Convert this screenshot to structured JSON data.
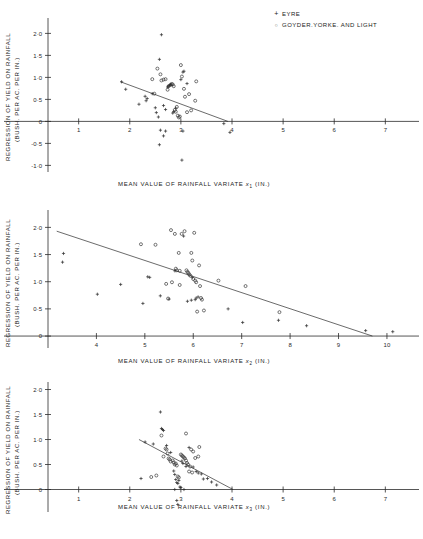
{
  "figure": {
    "legend": {
      "position": "top-right",
      "entries": [
        {
          "marker": "plus-marker",
          "symbol": "+",
          "label": "EYRE"
        },
        {
          "marker": "circle-marker",
          "symbol": "○",
          "label": "GOYDER.YORKE. AND LIGHT"
        }
      ]
    },
    "shared_ylabel_line1": "REGRESSION OF YIELD ON RAINFALL",
    "shared_ylabel_line2": "(BUSH. PER AC. PER IN.)"
  },
  "chart_data": [
    {
      "type": "scatter",
      "panel": 1,
      "title": "",
      "xlabel": "MEAN VALUE OF RAINFALL VARIATE x1 (IN.)",
      "xlabel_prefix": "MEAN VALUE OF RAINFALL  VARIATE ",
      "xlabel_var": "x",
      "xlabel_sub": "1",
      "xlabel_suffix": " (IN.)",
      "ylabel": "REGRESSION OF YIELD ON RAINFALL (BUSH. PER AC. PER IN.)",
      "xlim": [
        0.4,
        7.6
      ],
      "ylim": [
        -1.15,
        2.35
      ],
      "xticks": [
        1,
        2,
        3,
        4,
        5,
        6,
        7
      ],
      "xticklabels": [
        "1",
        "2",
        "3",
        "4",
        "5",
        "6",
        "7"
      ],
      "yticks": [
        -1.0,
        -0.5,
        0,
        0.5,
        1.0,
        1.5,
        2.0
      ],
      "yticklabels": [
        "-1·0",
        "-0·5",
        "0",
        "0·5",
        "1·0",
        "1·5",
        "2·0"
      ],
      "grid": false,
      "regression_line": {
        "x": [
          1.82,
          3.92
        ],
        "y": [
          0.9,
          0.0
        ]
      },
      "series": [
        {
          "name": "EYRE",
          "marker": "plus",
          "points": [
            [
              1.84,
              0.9
            ],
            [
              1.92,
              0.73
            ],
            [
              2.18,
              0.39
            ],
            [
              2.3,
              0.57
            ],
            [
              2.32,
              0.47
            ],
            [
              2.34,
              0.52
            ],
            [
              2.44,
              0.63
            ],
            [
              2.5,
              0.31
            ],
            [
              2.52,
              0.2
            ],
            [
              2.56,
              0.1
            ],
            [
              2.58,
              1.41
            ],
            [
              2.62,
              1.97
            ],
            [
              2.66,
              0.36
            ],
            [
              2.7,
              0.27
            ],
            [
              2.74,
              0.78
            ],
            [
              2.76,
              0.8
            ],
            [
              2.78,
              0.82
            ],
            [
              2.8,
              0.84
            ],
            [
              2.84,
              0.19
            ],
            [
              2.86,
              0.22
            ],
            [
              2.9,
              0.3
            ],
            [
              3.0,
              0.95
            ],
            [
              3.04,
              1.12
            ],
            [
              3.06,
              1.14
            ],
            [
              3.12,
              0.86
            ],
            [
              2.6,
              -0.2
            ],
            [
              2.7,
              -0.22
            ],
            [
              2.66,
              -0.33
            ],
            [
              2.58,
              -0.53
            ],
            [
              3.04,
              -0.22
            ],
            [
              3.84,
              -0.05
            ],
            [
              3.96,
              -0.25
            ],
            [
              3.02,
              -0.88
            ]
          ]
        },
        {
          "name": "GOYDER.YORKE. AND LIGHT",
          "marker": "circle",
          "points": [
            [
              2.54,
              1.2
            ],
            [
              2.6,
              1.07
            ],
            [
              2.62,
              0.93
            ],
            [
              2.66,
              0.95
            ],
            [
              2.7,
              0.96
            ],
            [
              2.74,
              0.72
            ],
            [
              2.76,
              0.8
            ],
            [
              2.8,
              0.83
            ],
            [
              2.82,
              0.85
            ],
            [
              2.84,
              0.84
            ],
            [
              2.86,
              0.8
            ],
            [
              2.88,
              0.26
            ],
            [
              2.9,
              0.22
            ],
            [
              2.92,
              0.33
            ],
            [
              2.94,
              0.13
            ],
            [
              2.96,
              0.09
            ],
            [
              2.98,
              0.11
            ],
            [
              3.0,
              1.28
            ],
            [
              3.02,
              1.02
            ],
            [
              3.06,
              0.74
            ],
            [
              3.08,
              0.56
            ],
            [
              3.12,
              0.21
            ],
            [
              3.16,
              0.62
            ],
            [
              3.2,
              0.25
            ],
            [
              3.28,
              0.47
            ],
            [
              3.3,
              0.91
            ],
            [
              2.48,
              0.63
            ],
            [
              2.44,
              0.96
            ]
          ]
        }
      ]
    },
    {
      "type": "scatter",
      "panel": 2,
      "title": "",
      "xlabel": "MEAN VALUE OF RAINFALL VARIATE x2 (IN.)",
      "xlabel_prefix": "MEAN VALUE OF RAINFALL  VARIATE ",
      "xlabel_var": "x",
      "xlabel_sub": "2",
      "xlabel_suffix": " (IN.)",
      "ylabel": "REGRESSION OF YIELD ON RAINFALL (BUSH. PER AC. PER IN.)",
      "xlim": [
        3.0,
        10.6
      ],
      "ylim": [
        -0.22,
        2.32
      ],
      "xticks": [
        4,
        5,
        6,
        7,
        8,
        9,
        10
      ],
      "xticklabels": [
        "4",
        "5",
        "6",
        "7",
        "8",
        "9",
        "10"
      ],
      "yticks": [
        0,
        0.5,
        1.0,
        1.5,
        2.0
      ],
      "yticklabels": [
        "0",
        "0·5",
        "1·0",
        "1·5",
        "2·0"
      ],
      "grid": false,
      "regression_line": {
        "x": [
          3.18,
          9.7
        ],
        "y": [
          1.93,
          0.0
        ]
      },
      "series": [
        {
          "name": "EYRE",
          "marker": "plus",
          "points": [
            [
              3.32,
              1.52
            ],
            [
              3.3,
              1.36
            ],
            [
              4.02,
              0.77
            ],
            [
              4.5,
              0.95
            ],
            [
              4.96,
              0.6
            ],
            [
              5.06,
              1.09
            ],
            [
              5.1,
              1.08
            ],
            [
              5.32,
              0.74
            ],
            [
              5.5,
              0.68
            ],
            [
              5.62,
              1.2
            ],
            [
              5.8,
              1.84
            ],
            [
              5.96,
              0.66
            ],
            [
              5.98,
              1.08
            ],
            [
              6.04,
              0.67
            ],
            [
              6.06,
              0.7
            ],
            [
              6.1,
              0.72
            ],
            [
              6.72,
              0.5
            ],
            [
              7.02,
              0.25
            ],
            [
              7.76,
              0.29
            ],
            [
              8.34,
              0.19
            ],
            [
              9.56,
              0.1
            ],
            [
              10.12,
              0.08
            ],
            [
              5.88,
              0.64
            ]
          ]
        },
        {
          "name": "GOYDER.YORKE. AND LIGHT",
          "marker": "circle",
          "points": [
            [
              4.92,
              1.69
            ],
            [
              5.22,
              1.68
            ],
            [
              5.54,
              1.95
            ],
            [
              5.62,
              1.88
            ],
            [
              5.64,
              1.24
            ],
            [
              5.66,
              1.21
            ],
            [
              5.7,
              1.53
            ],
            [
              5.72,
              1.2
            ],
            [
              5.76,
              1.88
            ],
            [
              5.82,
              1.93
            ],
            [
              5.86,
              1.21
            ],
            [
              5.88,
              1.18
            ],
            [
              5.9,
              1.16
            ],
            [
              5.92,
              1.13
            ],
            [
              5.94,
              1.11
            ],
            [
              5.96,
              1.53
            ],
            [
              5.98,
              1.39
            ],
            [
              6.0,
              1.05
            ],
            [
              6.02,
              1.9
            ],
            [
              6.04,
              1.02
            ],
            [
              6.06,
              0.99
            ],
            [
              6.12,
              1.3
            ],
            [
              6.14,
              0.92
            ],
            [
              6.16,
              0.7
            ],
            [
              6.18,
              0.67
            ],
            [
              6.22,
              0.47
            ],
            [
              6.52,
              1.02
            ],
            [
              7.08,
              0.92
            ],
            [
              7.78,
              0.44
            ],
            [
              5.44,
              0.96
            ],
            [
              5.56,
              0.99
            ],
            [
              5.48,
              0.69
            ],
            [
              6.08,
              0.45
            ],
            [
              5.72,
              0.94
            ]
          ]
        }
      ]
    },
    {
      "type": "scatter",
      "panel": 3,
      "title": "",
      "xlabel": "MEAN VALUE OF RAINFALL VARIATE x3 (IN.)",
      "xlabel_prefix": "MEAN VALUE OF RAINFALL  VARIATE ",
      "xlabel_var": "x",
      "xlabel_sub": "3",
      "xlabel_suffix": " (IN.)",
      "ylabel": "REGRESSION OF YIELD ON RAINFALL (BUSH. PER AC. PER IN.)",
      "xlim": [
        0.4,
        7.6
      ],
      "ylim": [
        -0.45,
        2.15
      ],
      "xticks": [
        1,
        2,
        3,
        4,
        5,
        6,
        7
      ],
      "xticklabels": [
        "1",
        "2",
        "3",
        "4",
        "5",
        "6",
        "7"
      ],
      "yticks": [
        0,
        0.5,
        1.0,
        1.5,
        2.0
      ],
      "yticklabels": [
        "0",
        "0·5",
        "1·0",
        "1·5",
        "2·0"
      ],
      "grid": false,
      "regression_line": {
        "x": [
          2.18,
          4.02
        ],
        "y": [
          1.0,
          0.0
        ]
      },
      "series": [
        {
          "name": "EYRE",
          "marker": "plus",
          "points": [
            [
              2.22,
              0.22
            ],
            [
              2.3,
              0.95
            ],
            [
              2.46,
              0.91
            ],
            [
              2.6,
              1.55
            ],
            [
              2.62,
              1.22
            ],
            [
              2.64,
              1.2
            ],
            [
              2.66,
              1.18
            ],
            [
              2.72,
              0.88
            ],
            [
              2.8,
              0.74
            ],
            [
              2.86,
              0.37
            ],
            [
              2.88,
              0.3
            ],
            [
              2.9,
              0.2
            ],
            [
              2.92,
              0.14
            ],
            [
              2.94,
              0.12
            ],
            [
              2.96,
              0.18
            ],
            [
              2.98,
              0.05
            ],
            [
              3.0,
              0.04
            ],
            [
              3.02,
              0.57
            ],
            [
              3.04,
              0.52
            ],
            [
              3.1,
              0.46
            ],
            [
              3.16,
              0.84
            ],
            [
              3.24,
              0.45
            ],
            [
              3.3,
              0.36
            ],
            [
              3.34,
              0.33
            ],
            [
              3.4,
              0.31
            ],
            [
              3.44,
              0.21
            ],
            [
              3.52,
              0.22
            ],
            [
              3.6,
              0.15
            ],
            [
              3.7,
              0.09
            ],
            [
              2.92,
              -0.22
            ],
            [
              2.94,
              -0.3
            ],
            [
              2.88,
              0.0
            ],
            [
              3.06,
              0.0
            ]
          ]
        },
        {
          "name": "GOYDER.YORKE. AND LIGHT",
          "marker": "circle",
          "points": [
            [
              2.42,
              0.25
            ],
            [
              2.52,
              0.28
            ],
            [
              2.62,
              1.08
            ],
            [
              2.7,
              0.82
            ],
            [
              2.72,
              0.8
            ],
            [
              2.76,
              0.62
            ],
            [
              2.78,
              0.6
            ],
            [
              2.8,
              0.56
            ],
            [
              2.84,
              0.58
            ],
            [
              2.86,
              0.54
            ],
            [
              2.88,
              0.5
            ],
            [
              2.9,
              0.52
            ],
            [
              2.92,
              0.48
            ],
            [
              2.94,
              0.26
            ],
            [
              2.96,
              0.24
            ],
            [
              3.0,
              0.7
            ],
            [
              3.02,
              0.68
            ],
            [
              3.04,
              0.66
            ],
            [
              3.06,
              0.64
            ],
            [
              3.08,
              0.62
            ],
            [
              3.1,
              0.58
            ],
            [
              3.12,
              0.53
            ],
            [
              3.14,
              0.5
            ],
            [
              3.18,
              0.46
            ],
            [
              3.2,
              0.8
            ],
            [
              3.24,
              0.76
            ],
            [
              3.28,
              0.63
            ],
            [
              3.34,
              0.66
            ],
            [
              3.36,
              0.85
            ],
            [
              3.1,
              1.12
            ],
            [
              2.66,
              0.66
            ],
            [
              2.74,
              0.72
            ],
            [
              3.16,
              0.36
            ],
            [
              3.22,
              0.34
            ]
          ]
        }
      ]
    }
  ]
}
